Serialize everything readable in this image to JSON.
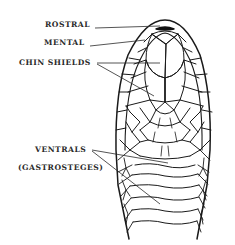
{
  "figure": {
    "labels": [
      {
        "id": "rostral",
        "text": "ROSTRAL"
      },
      {
        "id": "mental",
        "text": "MENTAL"
      },
      {
        "id": "chin_shields",
        "text": "CHIN SHIELDS"
      },
      {
        "id": "ventrals",
        "text": "VENTRALS"
      },
      {
        "id": "gastrosteges",
        "text": "(GASTROSTEGES)"
      }
    ],
    "colors": {
      "ink": "#1a1a1a",
      "label": "#2a2a2a",
      "background": "#ffffff",
      "rostral_fill": "#111111"
    }
  }
}
